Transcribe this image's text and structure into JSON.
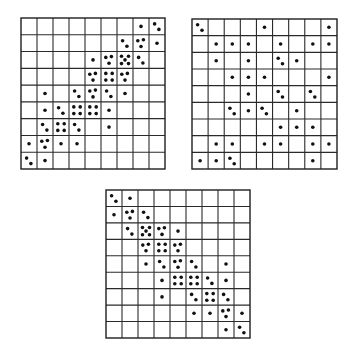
{
  "figure": {
    "dot_color": "#111111",
    "line_color": "#2a2a2a"
  },
  "panels": [
    {
      "name": "panel-top-left-positive-diagonal",
      "x": 21,
      "y": 18,
      "w": 144,
      "h": 151,
      "rows": 9,
      "cols": 9,
      "cells": [
        {
          "r": 0,
          "c": 7,
          "n": 1
        },
        {
          "r": 0,
          "c": 8,
          "n": 2
        },
        {
          "r": 1,
          "c": 6,
          "n": 2
        },
        {
          "r": 1,
          "c": 7,
          "n": 3
        },
        {
          "r": 1,
          "c": 8,
          "n": 1
        },
        {
          "r": 2,
          "c": 4,
          "n": 1
        },
        {
          "r": 2,
          "c": 5,
          "n": 3
        },
        {
          "r": 2,
          "c": 6,
          "n": 5
        },
        {
          "r": 2,
          "c": 7,
          "n": 2
        },
        {
          "r": 3,
          "c": 4,
          "n": 3
        },
        {
          "r": 3,
          "c": 5,
          "n": 4
        },
        {
          "r": 3,
          "c": 6,
          "n": 3
        },
        {
          "r": 4,
          "c": 1,
          "n": 1
        },
        {
          "r": 4,
          "c": 3,
          "n": 2
        },
        {
          "r": 4,
          "c": 4,
          "n": 3
        },
        {
          "r": 4,
          "c": 5,
          "n": 2
        },
        {
          "r": 4,
          "c": 6,
          "n": 1
        },
        {
          "r": 5,
          "c": 1,
          "n": 1
        },
        {
          "r": 5,
          "c": 2,
          "n": 2
        },
        {
          "r": 5,
          "c": 3,
          "n": 4
        },
        {
          "r": 5,
          "c": 4,
          "n": 4
        },
        {
          "r": 5,
          "c": 5,
          "n": 1
        },
        {
          "r": 6,
          "c": 1,
          "n": 2
        },
        {
          "r": 6,
          "c": 2,
          "n": 4
        },
        {
          "r": 6,
          "c": 3,
          "n": 2
        },
        {
          "r": 6,
          "c": 5,
          "n": 1
        },
        {
          "r": 7,
          "c": 0,
          "n": 1
        },
        {
          "r": 7,
          "c": 1,
          "n": 3
        },
        {
          "r": 7,
          "c": 2,
          "n": 1
        },
        {
          "r": 7,
          "c": 3,
          "n": 1
        },
        {
          "r": 8,
          "c": 0,
          "n": 2
        },
        {
          "r": 8,
          "c": 1,
          "n": 1
        }
      ]
    },
    {
      "name": "panel-top-right-uncorrelated",
      "x": 192,
      "y": 19,
      "w": 145,
      "h": 150,
      "rows": 9,
      "cols": 9,
      "cells": [
        {
          "r": 0,
          "c": 0,
          "n": 2
        },
        {
          "r": 0,
          "c": 4,
          "n": 1
        },
        {
          "r": 0,
          "c": 8,
          "n": 1
        },
        {
          "r": 1,
          "c": 1,
          "n": 1
        },
        {
          "r": 1,
          "c": 2,
          "n": 1
        },
        {
          "r": 1,
          "c": 3,
          "n": 1
        },
        {
          "r": 1,
          "c": 5,
          "n": 1
        },
        {
          "r": 1,
          "c": 7,
          "n": 1
        },
        {
          "r": 1,
          "c": 8,
          "n": 1
        },
        {
          "r": 2,
          "c": 1,
          "n": 1
        },
        {
          "r": 2,
          "c": 3,
          "n": 1
        },
        {
          "r": 2,
          "c": 5,
          "n": 2
        },
        {
          "r": 2,
          "c": 6,
          "n": 1
        },
        {
          "r": 3,
          "c": 2,
          "n": 1
        },
        {
          "r": 3,
          "c": 3,
          "n": 1
        },
        {
          "r": 3,
          "c": 4,
          "n": 1
        },
        {
          "r": 3,
          "c": 8,
          "n": 1
        },
        {
          "r": 4,
          "c": 3,
          "n": 1
        },
        {
          "r": 4,
          "c": 5,
          "n": 2
        },
        {
          "r": 4,
          "c": 7,
          "n": 2
        },
        {
          "r": 5,
          "c": 2,
          "n": 2
        },
        {
          "r": 5,
          "c": 3,
          "n": 1
        },
        {
          "r": 5,
          "c": 4,
          "n": 2
        },
        {
          "r": 5,
          "c": 6,
          "n": 1
        },
        {
          "r": 6,
          "c": 5,
          "n": 1
        },
        {
          "r": 6,
          "c": 6,
          "n": 1
        },
        {
          "r": 6,
          "c": 7,
          "n": 1
        },
        {
          "r": 7,
          "c": 1,
          "n": 1
        },
        {
          "r": 7,
          "c": 2,
          "n": 1
        },
        {
          "r": 7,
          "c": 4,
          "n": 1
        },
        {
          "r": 7,
          "c": 5,
          "n": 1
        },
        {
          "r": 7,
          "c": 7,
          "n": 1
        },
        {
          "r": 7,
          "c": 8,
          "n": 1
        },
        {
          "r": 8,
          "c": 0,
          "n": 1
        },
        {
          "r": 8,
          "c": 1,
          "n": 1
        },
        {
          "r": 8,
          "c": 2,
          "n": 2
        },
        {
          "r": 8,
          "c": 7,
          "n": 1
        }
      ]
    },
    {
      "name": "panel-bottom-negative-diagonal",
      "x": 106,
      "y": 190,
      "w": 144,
      "h": 148,
      "rows": 9,
      "cols": 9,
      "cells": [
        {
          "r": 0,
          "c": 0,
          "n": 2
        },
        {
          "r": 0,
          "c": 1,
          "n": 1
        },
        {
          "r": 1,
          "c": 0,
          "n": 1
        },
        {
          "r": 1,
          "c": 1,
          "n": 3
        },
        {
          "r": 1,
          "c": 2,
          "n": 2
        },
        {
          "r": 2,
          "c": 1,
          "n": 2
        },
        {
          "r": 2,
          "c": 2,
          "n": 5
        },
        {
          "r": 2,
          "c": 3,
          "n": 3
        },
        {
          "r": 2,
          "c": 4,
          "n": 1
        },
        {
          "r": 3,
          "c": 2,
          "n": 3
        },
        {
          "r": 3,
          "c": 3,
          "n": 4
        },
        {
          "r": 3,
          "c": 4,
          "n": 3
        },
        {
          "r": 4,
          "c": 2,
          "n": 1
        },
        {
          "r": 4,
          "c": 3,
          "n": 2
        },
        {
          "r": 4,
          "c": 4,
          "n": 3
        },
        {
          "r": 4,
          "c": 5,
          "n": 2
        },
        {
          "r": 4,
          "c": 7,
          "n": 1
        },
        {
          "r": 5,
          "c": 3,
          "n": 1
        },
        {
          "r": 5,
          "c": 4,
          "n": 4
        },
        {
          "r": 5,
          "c": 5,
          "n": 4
        },
        {
          "r": 5,
          "c": 6,
          "n": 2
        },
        {
          "r": 5,
          "c": 7,
          "n": 1
        },
        {
          "r": 6,
          "c": 3,
          "n": 1
        },
        {
          "r": 6,
          "c": 5,
          "n": 2
        },
        {
          "r": 6,
          "c": 6,
          "n": 4
        },
        {
          "r": 6,
          "c": 7,
          "n": 2
        },
        {
          "r": 7,
          "c": 5,
          "n": 1
        },
        {
          "r": 7,
          "c": 6,
          "n": 1
        },
        {
          "r": 7,
          "c": 7,
          "n": 3
        },
        {
          "r": 7,
          "c": 8,
          "n": 1
        },
        {
          "r": 8,
          "c": 7,
          "n": 1
        },
        {
          "r": 8,
          "c": 8,
          "n": 2
        }
      ]
    }
  ],
  "dot_layouts": {
    "1": [
      [
        0.5,
        0.5
      ]
    ],
    "2": [
      [
        0.35,
        0.35
      ],
      [
        0.62,
        0.68
      ]
    ],
    "3": [
      [
        0.3,
        0.35
      ],
      [
        0.65,
        0.3
      ],
      [
        0.5,
        0.7
      ]
    ],
    "4": [
      [
        0.3,
        0.3
      ],
      [
        0.7,
        0.3
      ],
      [
        0.3,
        0.7
      ],
      [
        0.7,
        0.7
      ]
    ],
    "5": [
      [
        0.28,
        0.28
      ],
      [
        0.72,
        0.28
      ],
      [
        0.5,
        0.5
      ],
      [
        0.28,
        0.72
      ],
      [
        0.72,
        0.72
      ]
    ]
  }
}
